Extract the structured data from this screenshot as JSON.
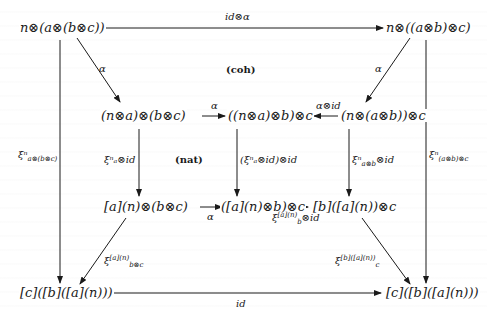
{
  "diagram": {
    "title": "",
    "nodes": {
      "top_left": "n⊗(a⊗(b⊗c))",
      "top_right": "n⊗((a⊗b)⊗c)",
      "mid_left": "(n⊗a)⊗(b⊗c)",
      "mid_center": "((n⊗a)⊗b)⊗c",
      "mid_right": "(n⊗(a⊗b))⊗c",
      "low_left": "[a](n)⊗(b⊗c)",
      "low_center": "([a](n)⊗b)⊗c",
      "low_right": "[b]([a](n))⊗c",
      "bottom_left": "[c]([b]([a](n)))",
      "bottom_right": "[c]([b]([a](n)))"
    },
    "edge_labels": {
      "top": "id⊗α",
      "diag_top_left": "α",
      "diag_top_right": "α",
      "mid_left_to_center": "α",
      "mid_right_to_center": "α⊗id",
      "outer_left": "ξⁿ",
      "outer_left_sub": "a⊗(b⊗c)",
      "outer_right": "ξⁿ",
      "outer_right_sub": "(a⊗b)⊗c",
      "inner_left": "ξⁿₐ⊗id",
      "inner_center": "(ξⁿₐ⊗id)⊗id",
      "inner_right": "ξⁿ",
      "inner_right_sub": "a⊗b",
      "inner_right_tail": "⊗id",
      "low_left_to_center": "α",
      "low_center_to_right": "ξ",
      "low_center_to_right_sup": "[a](n)",
      "low_center_to_right_sub": "b",
      "low_center_to_right_tail": "⊗id",
      "diag_bottom_left": "ξ",
      "diag_bottom_left_sup": "[a](n)",
      "diag_bottom_left_sub": "b⊗c",
      "diag_bottom_right": "ξ",
      "diag_bottom_right_sup": "[b]([a](n))",
      "diag_bottom_right_sub": "c",
      "bottom": "id"
    },
    "regions": {
      "coh": "(coh)",
      "nat": "(nat)"
    }
  },
  "colors": {
    "ink": "#1a1a1a",
    "background": "#ffffff"
  }
}
